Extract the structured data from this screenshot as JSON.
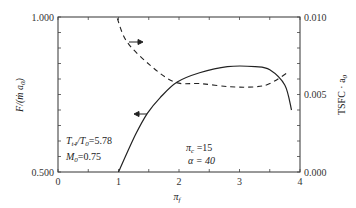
{
  "chart_data": {
    "type": "line",
    "title": "",
    "xlabel": "π_f",
    "ylabel": "F/(ṁ a_0)",
    "ylabel_right": "TSFC · a_0",
    "xlim": [
      0,
      4
    ],
    "ylim": [
      0.5,
      1.0
    ],
    "ylim_right": [
      0.0,
      0.01
    ],
    "grid": false,
    "x_ticks": [
      "0",
      "1",
      "2",
      "3",
      "4"
    ],
    "y_ticks_left": [
      "0.500",
      "1.000"
    ],
    "y_ticks_right": [
      "0.000",
      "0.005",
      "0.010"
    ],
    "series": [
      {
        "name": "F/(ṁ a0)",
        "axis": "left",
        "style": "solid",
        "x": [
          1.0,
          1.28,
          1.48,
          1.69,
          1.97,
          2.34,
          2.8,
          3.26,
          3.5,
          3.75,
          3.86
        ],
        "values": [
          0.5,
          0.62,
          0.69,
          0.74,
          0.79,
          0.82,
          0.84,
          0.84,
          0.83,
          0.78,
          0.7
        ]
      },
      {
        "name": "TSFC · a0",
        "axis": "right",
        "style": "dashed",
        "x": [
          0.98,
          1.14,
          1.52,
          1.93,
          2.35,
          2.85,
          3.26,
          3.5,
          3.79
        ],
        "values": [
          0.0099,
          0.0084,
          0.0069,
          0.0058,
          0.0057,
          0.0055,
          0.0055,
          0.0057,
          0.0064
        ]
      }
    ],
    "annotations": [
      {
        "text": "T_t4/T_0=5.78",
        "position": "lower-left"
      },
      {
        "text": "M_0=0.75",
        "position": "lower-left"
      },
      {
        "text": "π_c =15",
        "position": "lower-center"
      },
      {
        "text": "α = 40",
        "position": "lower-center"
      },
      {
        "text": "→ (dashed curve refers to right axis)",
        "position": "upper-left"
      },
      {
        "text": "← (solid curve refers to left axis)",
        "position": "center-left"
      }
    ]
  },
  "labels": {
    "x_ticks": [
      "0",
      "1",
      "2",
      "3",
      "4"
    ],
    "y_left_top": "1.000",
    "y_left_bottom": "0.500",
    "y_right_top": "0.010",
    "y_right_mid": "0.005",
    "y_right_bottom": "0.000",
    "ylabel_left_main": "F/(ṁ a",
    "ylabel_left_sub": "0",
    "ylabel_left_close": ")",
    "ylabel_right_main": "TSFC · a",
    "ylabel_right_sub": "0",
    "xlabel_main": "π",
    "xlabel_sub": "f",
    "ann1_a": "T",
    "ann1_b": "t4",
    "ann1_c": "/T",
    "ann1_d": "0",
    "ann1_e": "=5.78",
    "ann2_a": "M",
    "ann2_b": "0",
    "ann2_c": "=0.75",
    "ann3_a": "π",
    "ann3_b": "c",
    "ann3_c": " =15",
    "ann4": "α = 40"
  }
}
